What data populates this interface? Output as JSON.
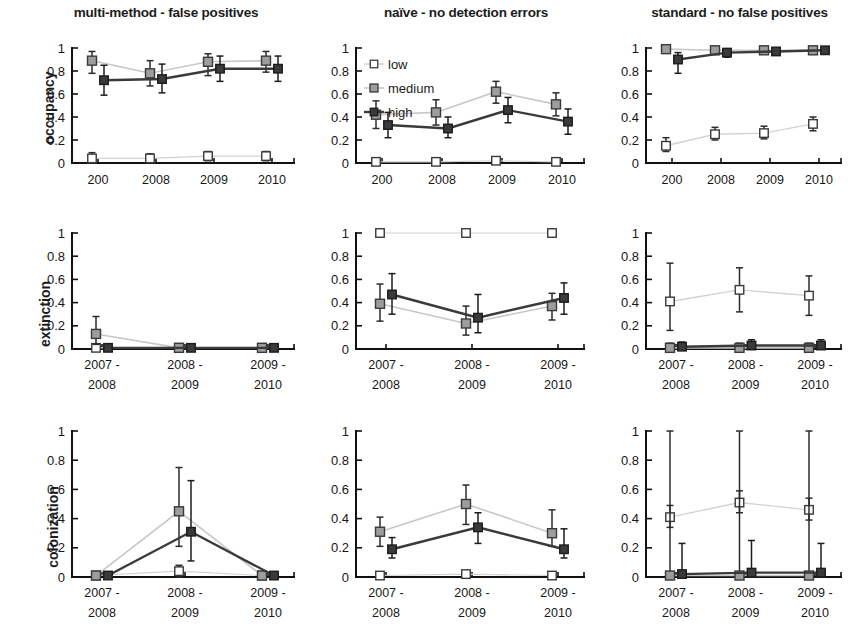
{
  "figure": {
    "ylabels": [
      "occupancy",
      "extinction",
      "colonization"
    ],
    "legend": {
      "position": "top-left of middle panel, row 1",
      "entries": [
        {
          "label": "low",
          "color": "#cfcfcf",
          "marker": "open-square"
        },
        {
          "label": "medium",
          "color": "#9a9a9a",
          "marker": "gray-square"
        },
        {
          "label": "high",
          "color": "#333333",
          "marker": "dark-square"
        }
      ]
    },
    "axis": {
      "ylim": [
        0,
        1
      ],
      "yticks": [
        0,
        0.2,
        0.4,
        0.6,
        0.8,
        1
      ],
      "yticklabels": [
        "0",
        "0.2",
        "0.4",
        "0.6",
        "0.8",
        "1"
      ],
      "grid": false
    },
    "column_titles": [
      "multi-method - false positives",
      "naïve - no detection errors",
      "standard -  no false positives"
    ],
    "xticklabels_occupancy": [
      "200",
      "2008",
      "2009",
      "2010"
    ],
    "xticklabels_transition": [
      [
        "2007 -",
        "2008"
      ],
      [
        "2008 -",
        "2009"
      ],
      [
        "2009 -",
        "2010"
      ]
    ]
  },
  "chart_data": [
    {
      "id": "occupancy-multimethod",
      "type": "line",
      "title": "multi-method - false positives",
      "xlabel": "",
      "ylabel": "occupancy",
      "ylim": [
        0,
        1
      ],
      "categories": [
        "200",
        "2008",
        "2009",
        "2010"
      ],
      "series": [
        {
          "name": "low",
          "values": [
            0.04,
            0.04,
            0.06,
            0.06
          ],
          "err_low": [
            0.04,
            0.03,
            0.04,
            0.04
          ],
          "err_high": [
            0.05,
            0.04,
            0.04,
            0.04
          ]
        },
        {
          "name": "medium",
          "values": [
            0.89,
            0.78,
            0.88,
            0.89
          ],
          "err_low": [
            0.11,
            0.11,
            0.12,
            0.1
          ],
          "err_high": [
            0.08,
            0.11,
            0.07,
            0.08
          ]
        },
        {
          "name": "high",
          "values": [
            0.72,
            0.73,
            0.82,
            0.82
          ],
          "err_low": [
            0.13,
            0.12,
            0.11,
            0.11
          ],
          "err_high": [
            0.13,
            0.13,
            0.11,
            0.11
          ]
        }
      ]
    },
    {
      "id": "occupancy-naive",
      "type": "line",
      "title": "naïve - no detection errors",
      "xlabel": "",
      "ylabel": "occupancy",
      "ylim": [
        0,
        1
      ],
      "categories": [
        "200",
        "2008",
        "2009",
        "2010"
      ],
      "series": [
        {
          "name": "low",
          "values": [
            0.01,
            0.01,
            0.02,
            0.01
          ],
          "err_low": [
            0.01,
            0.01,
            0.01,
            0.01
          ],
          "err_high": [
            0.01,
            0.01,
            0.01,
            0.01
          ]
        },
        {
          "name": "medium",
          "values": [
            0.42,
            0.44,
            0.62,
            0.51
          ],
          "err_low": [
            0.12,
            0.11,
            0.1,
            0.1
          ],
          "err_high": [
            0.12,
            0.11,
            0.09,
            0.1
          ]
        },
        {
          "name": "high",
          "values": [
            0.33,
            0.3,
            0.46,
            0.36
          ],
          "err_low": [
            0.11,
            0.08,
            0.11,
            0.11
          ],
          "err_high": [
            0.11,
            0.1,
            0.11,
            0.11
          ]
        }
      ]
    },
    {
      "id": "occupancy-standard",
      "type": "line",
      "title": "standard -  no false positives",
      "xlabel": "",
      "ylabel": "occupancy",
      "ylim": [
        0,
        1
      ],
      "categories": [
        "200",
        "2008",
        "2009",
        "2010"
      ],
      "series": [
        {
          "name": "low",
          "values": [
            0.15,
            0.25,
            0.26,
            0.34
          ],
          "err_low": [
            0.05,
            0.05,
            0.05,
            0.06
          ],
          "err_high": [
            0.07,
            0.06,
            0.06,
            0.06
          ]
        },
        {
          "name": "medium",
          "values": [
            0.99,
            0.98,
            0.98,
            0.98
          ],
          "err_low": [
            0.02,
            0.03,
            0.02,
            0.03
          ],
          "err_high": [
            0.01,
            0.02,
            0.02,
            0.02
          ]
        },
        {
          "name": "high",
          "values": [
            0.9,
            0.96,
            0.97,
            0.98
          ],
          "err_low": [
            0.12,
            0.04,
            0.03,
            0.02
          ],
          "err_high": [
            0.06,
            0.03,
            0.02,
            0.02
          ]
        }
      ]
    },
    {
      "id": "extinction-multimethod",
      "type": "line",
      "title": "multi-method - false positives",
      "xlabel": "",
      "ylabel": "extinction",
      "ylim": [
        0,
        1
      ],
      "categories": [
        "2007 - 2008",
        "2008 - 2009",
        "2009 - 2010"
      ],
      "series": [
        {
          "name": "low",
          "values": [
            0.01,
            0.01,
            0.01
          ],
          "err_low": [
            0.01,
            0.01,
            0.01
          ],
          "err_high": [
            0.01,
            0.01,
            0.01
          ]
        },
        {
          "name": "medium",
          "values": [
            0.13,
            0.01,
            0.01
          ],
          "err_low": [
            0.09,
            0.01,
            0.01
          ],
          "err_high": [
            0.15,
            0.01,
            0.01
          ]
        },
        {
          "name": "high",
          "values": [
            0.01,
            0.01,
            0.01
          ],
          "err_low": [
            0.01,
            0.01,
            0.01
          ],
          "err_high": [
            0.01,
            0.01,
            0.01
          ]
        }
      ]
    },
    {
      "id": "extinction-naive",
      "type": "line",
      "title": "naïve - no detection errors",
      "xlabel": "",
      "ylabel": "extinction",
      "ylim": [
        0,
        1
      ],
      "categories": [
        "2007 - 2008",
        "2008 - 2009",
        "2009 - 2010"
      ],
      "series": [
        {
          "name": "low",
          "values": [
            1.0,
            1.0,
            1.0
          ],
          "err_low": [
            0,
            0,
            0
          ],
          "err_high": [
            0,
            0,
            0
          ]
        },
        {
          "name": "medium",
          "values": [
            0.39,
            0.22,
            0.37
          ],
          "err_low": [
            0.15,
            0.1,
            0.12
          ],
          "err_high": [
            0.17,
            0.15,
            0.11
          ]
        },
        {
          "name": "high",
          "values": [
            0.47,
            0.27,
            0.44
          ],
          "err_low": [
            0.17,
            0.13,
            0.14
          ],
          "err_high": [
            0.18,
            0.2,
            0.13
          ]
        }
      ]
    },
    {
      "id": "extinction-standard",
      "type": "line",
      "title": "standard -  no false positives",
      "xlabel": "",
      "ylabel": "extinction",
      "ylim": [
        0,
        1
      ],
      "categories": [
        "2007 - 2008",
        "2008 - 2009",
        "2009 - 2010"
      ],
      "series": [
        {
          "name": "low",
          "values": [
            0.41,
            0.51,
            0.46
          ],
          "err_low": [
            0.25,
            0.19,
            0.17
          ],
          "err_high": [
            0.33,
            0.19,
            0.17
          ]
        },
        {
          "name": "medium",
          "values": [
            0.01,
            0.01,
            0.01
          ],
          "err_low": [
            0.01,
            0.01,
            0.01
          ],
          "err_high": [
            0.04,
            0.04,
            0.04
          ]
        },
        {
          "name": "high",
          "values": [
            0.02,
            0.03,
            0.03
          ],
          "err_low": [
            0.02,
            0.03,
            0.03
          ],
          "err_high": [
            0.04,
            0.05,
            0.05
          ]
        }
      ]
    },
    {
      "id": "colonization-multimethod",
      "type": "line",
      "title": "multi-method - false positives",
      "xlabel": "",
      "ylabel": "colonization",
      "ylim": [
        0,
        1
      ],
      "categories": [
        "2007 - 2008",
        "2008 - 2009",
        "2009 - 2010"
      ],
      "series": [
        {
          "name": "low",
          "values": [
            0.01,
            0.04,
            0.01
          ],
          "err_low": [
            0.01,
            0.04,
            0.01
          ],
          "err_high": [
            0.01,
            0.04,
            0.01
          ]
        },
        {
          "name": "medium",
          "values": [
            0.01,
            0.45,
            0.01
          ],
          "err_low": [
            0.01,
            0.24,
            0.01
          ],
          "err_high": [
            0.01,
            0.3,
            0.01
          ]
        },
        {
          "name": "high",
          "values": [
            0.01,
            0.31,
            0.01
          ],
          "err_low": [
            0.01,
            0.2,
            0.01
          ],
          "err_high": [
            0.01,
            0.35,
            0.01
          ]
        }
      ]
    },
    {
      "id": "colonization-naive",
      "type": "line",
      "title": "naïve - no detection errors",
      "xlabel": "",
      "ylabel": "colonization",
      "ylim": [
        0,
        1
      ],
      "categories": [
        "2007 - 2008",
        "2008 - 2009",
        "2009 - 2010"
      ],
      "series": [
        {
          "name": "low",
          "values": [
            0.01,
            0.02,
            0.01
          ],
          "err_low": [
            0.01,
            0.01,
            0.01
          ],
          "err_high": [
            0.01,
            0.01,
            0.01
          ]
        },
        {
          "name": "medium",
          "values": [
            0.31,
            0.5,
            0.3
          ],
          "err_low": [
            0.1,
            0.14,
            0.09
          ],
          "err_high": [
            0.1,
            0.13,
            0.16
          ]
        },
        {
          "name": "high",
          "values": [
            0.19,
            0.34,
            0.19
          ],
          "err_low": [
            0.06,
            0.11,
            0.06
          ],
          "err_high": [
            0.08,
            0.1,
            0.14
          ]
        }
      ]
    },
    {
      "id": "colonization-standard",
      "type": "line",
      "title": "standard -  no false positives",
      "xlabel": "",
      "ylabel": "colonization",
      "ylim": [
        0,
        1
      ],
      "categories": [
        "2007 - 2008",
        "2008 - 2009",
        "2009 - 2010"
      ],
      "series": [
        {
          "name": "low",
          "values": [
            0.41,
            0.51,
            0.46
          ],
          "err_low": [
            0.07,
            0.07,
            0.07
          ],
          "err_high": [
            0.08,
            0.08,
            0.08
          ]
        },
        {
          "name": "medium",
          "values": [
            0.01,
            0.01,
            0.01
          ],
          "err_low": [
            0.01,
            0.01,
            0.01
          ],
          "err_high": [
            0.99,
            0.99,
            0.99
          ]
        },
        {
          "name": "high",
          "values": [
            0.02,
            0.03,
            0.03
          ],
          "err_low": [
            0.02,
            0.03,
            0.03
          ],
          "err_high": [
            0.21,
            0.22,
            0.2
          ]
        }
      ]
    }
  ]
}
